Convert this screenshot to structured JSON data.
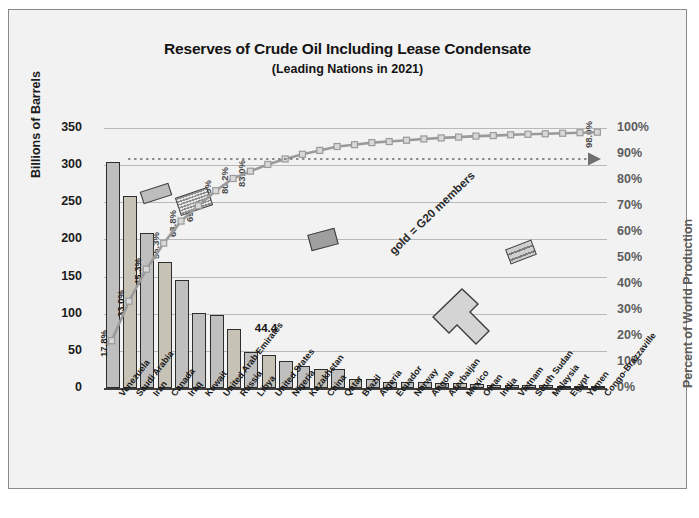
{
  "chart_data": {
    "type": "bar",
    "title": "Reserves of Crude Oil Including Lease Condensate",
    "subtitle": "(Leading Nations in 2021)",
    "ylabel": "Billions of Barrels",
    "ylabel_right": "Percent of World Production",
    "xlabel": "",
    "ylim": [
      0,
      350
    ],
    "ylim_right": [
      0,
      100
    ],
    "grid": true,
    "yticks": [
      "350",
      "300",
      "250",
      "200",
      "150",
      "100",
      "50",
      "0"
    ],
    "yticks_right": [
      "100%",
      "90%",
      "80%",
      "70%",
      "60%",
      "50%",
      "40%",
      "30%",
      "20%",
      "10%",
      "0%"
    ],
    "categories": [
      "Venezuela",
      "Saudi Arabia",
      "Iran",
      "Canada",
      "Iraq",
      "Kuwait",
      "United Arab Emirates",
      "Russia",
      "Libya",
      "United States",
      "Nigeria",
      "Kazakhstan",
      "China",
      "Qatar",
      "Brazil",
      "Algeria",
      "Ecuador",
      "Norway",
      "Angola",
      "Azerbaijan",
      "Mexico",
      "Oman",
      "India",
      "Vietnam",
      "South Sudan",
      "Malaysia",
      "Egypt",
      "Yemen",
      "Congo-Brazzaville"
    ],
    "values": [
      303.8,
      258.6,
      208.6,
      170.3,
      145.0,
      101.5,
      97.8,
      80.0,
      48.4,
      44.4,
      36.9,
      30.0,
      26.0,
      25.2,
      12.7,
      12.2,
      8.3,
      7.9,
      7.8,
      7.0,
      6.1,
      5.4,
      4.6,
      4.4,
      3.5,
      3.6,
      3.3,
      3.0,
      2.9
    ],
    "cumulative_percent": [
      17.8,
      33.0,
      45.3,
      55.3,
      63.8,
      69.7,
      75.5,
      80.2,
      83.0,
      85.6,
      87.7,
      89.5,
      91.0,
      92.5,
      93.2,
      94.0,
      94.4,
      94.9,
      95.4,
      95.8,
      96.1,
      96.5,
      96.7,
      97.0,
      97.2,
      97.4,
      97.6,
      97.8,
      98.0
    ],
    "cumulative_labels_shown": [
      "17.8%",
      "33.0%",
      "45.3%",
      "55.3%",
      "63.8%",
      "69.7%",
      "75.5%",
      "80.2%",
      "83.0%",
      "98.0%"
    ],
    "data_labels": [
      {
        "text": "44.4",
        "category": "United States"
      }
    ],
    "g20_members": [
      "Saudi Arabia",
      "Canada",
      "Russia",
      "United States",
      "China",
      "Brazil",
      "Mexico",
      "India"
    ],
    "annotations": [
      {
        "name": "g20-callout",
        "text": "gold = G20 members"
      }
    ],
    "series": [
      {
        "name": "Reserves",
        "type": "bar"
      },
      {
        "name": "Cumulative Percent of World Production",
        "type": "line"
      }
    ],
    "colors": {
      "bar_g20": "#c6c2b6",
      "bar_other": "#bfbfbf",
      "line": "#9a9a9a",
      "grid": "#b9b9b9",
      "axis": "#3f3f3f",
      "background": "#f2f2f2",
      "text": "#141414",
      "right_axis_text": "#5d5d5d"
    }
  }
}
